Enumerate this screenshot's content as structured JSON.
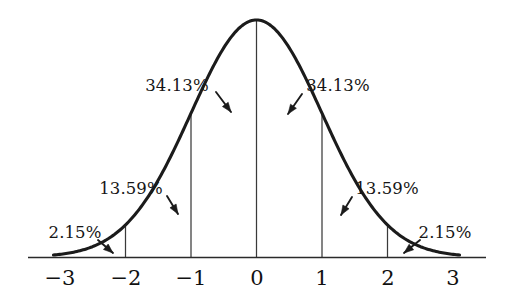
{
  "figure": {
    "background_color": "#ffffff",
    "curve_color": "#1b1b1b",
    "axis_color": "#2a2a2a",
    "text_color": "#111111"
  },
  "axis": {
    "name": "x-axis",
    "ticks": [
      {
        "value": -3,
        "label": "−3",
        "x": 60
      },
      {
        "value": -2,
        "label": "−2",
        "x": 126
      },
      {
        "value": -1,
        "label": "−1",
        "x": 191
      },
      {
        "value": 0,
        "label": "0",
        "x": 257
      },
      {
        "value": 1,
        "label": "1",
        "x": 322
      },
      {
        "value": 2,
        "label": "2",
        "x": 388
      },
      {
        "value": 3,
        "label": "3",
        "x": 453
      }
    ],
    "label_y": 285,
    "baseline_y": 257,
    "line_start_x": 28,
    "line_end_x": 486
  },
  "annotations": [
    {
      "name": "annotation-minus-one-to-zero",
      "text": "34.13%",
      "x": 177,
      "y": 91,
      "anchor": "middle",
      "arrow": {
        "x1": 216,
        "y1": 92,
        "x2": 231,
        "y2": 112
      }
    },
    {
      "name": "annotation-zero-to-one",
      "text": "34.13%",
      "x": 338,
      "y": 91,
      "anchor": "middle",
      "arrow": {
        "x1": 302,
        "y1": 94,
        "x2": 288,
        "y2": 114
      }
    },
    {
      "name": "annotation-minus-two-to-minus-one",
      "text": "13.59%",
      "x": 131,
      "y": 194,
      "anchor": "middle",
      "arrow": {
        "x1": 167,
        "y1": 196,
        "x2": 178,
        "y2": 214
      }
    },
    {
      "name": "annotation-one-to-two",
      "text": "13.59%",
      "x": 387,
      "y": 194,
      "anchor": "middle",
      "arrow": {
        "x1": 352,
        "y1": 197,
        "x2": 341,
        "y2": 215
      }
    },
    {
      "name": "annotation-beyond-minus-two",
      "text": "2.15%",
      "x": 75,
      "y": 238,
      "anchor": "middle",
      "arrow": {
        "x1": 98,
        "y1": 240,
        "x2": 113,
        "y2": 253
      }
    },
    {
      "name": "annotation-beyond-two",
      "text": "2.15%",
      "x": 445,
      "y": 238,
      "anchor": "middle",
      "arrow": {
        "x1": 420,
        "y1": 240,
        "x2": 404,
        "y2": 253
      }
    }
  ],
  "chart_data": {
    "type": "line",
    "xlabel": "",
    "ylabel": "",
    "xlim": [
      -3.35,
      3.35
    ],
    "ylim": [
      0,
      0.4
    ],
    "grid": false,
    "legend_position": "none",
    "curve": {
      "name": "standard-normal-pdf",
      "formula": "y = exp(-x^2 / 2) / sqrt(2*pi)",
      "mean": 0,
      "std_dev": 1,
      "x": [
        -3.1,
        -3.0,
        -2.75,
        -2.5,
        -2.25,
        -2.0,
        -1.75,
        -1.5,
        -1.25,
        -1.0,
        -0.75,
        -0.5,
        -0.25,
        0,
        0.25,
        0.5,
        0.75,
        1.0,
        1.25,
        1.5,
        1.75,
        2.0,
        2.25,
        2.5,
        2.75,
        3.0,
        3.1
      ],
      "y": [
        0.0033,
        0.0044,
        0.0091,
        0.0175,
        0.0317,
        0.054,
        0.0863,
        0.1295,
        0.1826,
        0.242,
        0.3011,
        0.3521,
        0.3867,
        0.3989,
        0.3867,
        0.3521,
        0.3011,
        0.242,
        0.1826,
        0.1295,
        0.0863,
        0.054,
        0.0317,
        0.0175,
        0.0091,
        0.0044,
        0.0033
      ]
    },
    "segments": [
      {
        "name": "left-tail",
        "range": "(-inf, -2]",
        "percent": 2.15,
        "label": "2.15%"
      },
      {
        "name": "minus-two-to-minus-one",
        "range": "[-2, -1]",
        "percent": 13.59,
        "label": "13.59%"
      },
      {
        "name": "minus-one-to-zero",
        "range": "[-1, 0]",
        "percent": 34.13,
        "label": "34.13%"
      },
      {
        "name": "zero-to-one",
        "range": "[0, 1]",
        "percent": 34.13,
        "label": "34.13%"
      },
      {
        "name": "one-to-two",
        "range": "[1, 2]",
        "percent": 13.59,
        "label": "13.59%"
      },
      {
        "name": "right-tail",
        "range": "[2, +inf)",
        "percent": 2.15,
        "label": "2.15%"
      }
    ],
    "vertical_lines_at": [
      -2,
      -1,
      0,
      1,
      2
    ],
    "tick_labels": [
      "−3",
      "−2",
      "−1",
      "0",
      "1",
      "2",
      "3"
    ]
  }
}
